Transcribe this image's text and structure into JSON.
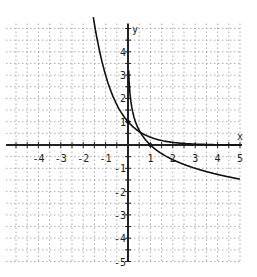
{
  "chart_data": {
    "type": "line",
    "title": "",
    "xlabel": "x",
    "ylabel": "y",
    "xlim": [
      -5,
      5
    ],
    "ylim": [
      -5,
      5
    ],
    "grid": true,
    "grid_minor_step": 0.5,
    "x_ticks": [
      "-4",
      "-3",
      "-2",
      "-1",
      "1",
      "2",
      "3",
      "4",
      "5"
    ],
    "y_ticks": [
      "4",
      "3",
      "2",
      "1",
      "-1",
      "-2",
      "-3",
      "-4",
      "-5"
    ],
    "series": [
      {
        "name": "exponential",
        "formula": "y = (1/3)^x",
        "points": [
          [
            -1.5,
            5.2
          ],
          [
            -1,
            3
          ],
          [
            -0.5,
            1.73
          ],
          [
            0,
            1
          ],
          [
            0.5,
            0.58
          ],
          [
            1,
            0.33
          ],
          [
            2,
            0.11
          ],
          [
            3,
            0.04
          ],
          [
            4,
            0.01
          ],
          [
            5,
            0.004
          ]
        ]
      },
      {
        "name": "logarithmic",
        "formula": "y = log_(1/3)(x)",
        "points": [
          [
            0.03,
            3.2
          ],
          [
            0.1,
            2.1
          ],
          [
            0.25,
            1.26
          ],
          [
            0.5,
            0.63
          ],
          [
            1,
            0
          ],
          [
            2,
            -0.63
          ],
          [
            3,
            -1
          ],
          [
            4,
            -1.26
          ],
          [
            5,
            -1.46
          ]
        ]
      }
    ],
    "legend": []
  },
  "axes": {
    "x_label": "x",
    "y_label": "y"
  }
}
